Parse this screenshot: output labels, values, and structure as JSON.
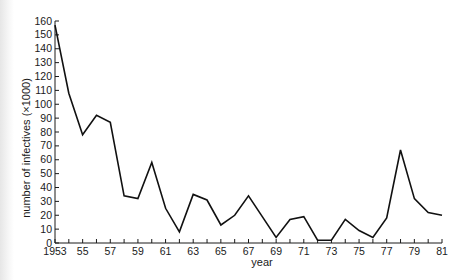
{
  "chart_data": {
    "type": "line",
    "title": "",
    "xlabel": "year",
    "ylabel": "number of infectives (×1000)",
    "x": [
      1953,
      1954,
      1955,
      1956,
      1957,
      1958,
      1959,
      1960,
      1961,
      1962,
      1963,
      1964,
      1965,
      1966,
      1967,
      1968,
      1969,
      1970,
      1971,
      1972,
      1973,
      1974,
      1975,
      1976,
      1977,
      1978,
      1979,
      1980,
      1981
    ],
    "series": [
      {
        "name": "infectives",
        "values": [
          157,
          108,
          78,
          92,
          87,
          34,
          32,
          58,
          25,
          8,
          35,
          31,
          13,
          20,
          34,
          19,
          4,
          17,
          19,
          2,
          2,
          17,
          9,
          4,
          18,
          67,
          32,
          22,
          20
        ]
      }
    ],
    "xlim": [
      1953,
      1981
    ],
    "ylim": [
      0,
      160
    ],
    "x_tick_labels": [
      "1953",
      "55",
      "57",
      "59",
      "61",
      "63",
      "65",
      "67",
      "69",
      "71",
      "73",
      "75",
      "77",
      "79",
      "81"
    ],
    "x_tick_label_years": [
      1953,
      1955,
      1957,
      1959,
      1961,
      1963,
      1965,
      1967,
      1969,
      1971,
      1973,
      1975,
      1977,
      1979,
      1981
    ],
    "y_ticks": [
      0,
      10,
      20,
      30,
      40,
      50,
      60,
      70,
      80,
      90,
      100,
      110,
      120,
      130,
      140,
      150,
      160
    ],
    "grid": false,
    "legend": null
  },
  "colors": {
    "line": "#111111",
    "axis": "#1a1a1a",
    "background": "#ffffff"
  }
}
